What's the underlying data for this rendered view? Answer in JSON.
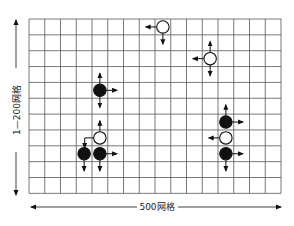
{
  "diagram": {
    "grid": {
      "columns": 16,
      "rows": 11,
      "left": 29,
      "top": 19,
      "cell_w": 15.75,
      "cell_h": 15.85,
      "line_color": "#555555"
    },
    "labels": {
      "horizontal": "500网格",
      "vertical": "1—200网格"
    },
    "stones": [
      {
        "id": "black-1",
        "color": "black",
        "col": 4,
        "row": 4,
        "arrows": [
          "up",
          "down",
          "right"
        ]
      },
      {
        "id": "white-1",
        "color": "white",
        "col": 8,
        "row": 0,
        "arrows": [
          "left",
          "down"
        ]
      },
      {
        "id": "white-2",
        "color": "white",
        "col": 11,
        "row": 2,
        "arrows": [
          "up",
          "down",
          "left"
        ]
      },
      {
        "id": "white-3",
        "color": "white",
        "col": 4,
        "row": 7,
        "arrows": [
          "up",
          "left-down"
        ]
      },
      {
        "id": "black-2",
        "color": "black",
        "col": 3,
        "row": 8,
        "arrows": [
          "down"
        ]
      },
      {
        "id": "black-3",
        "color": "black",
        "col": 4,
        "row": 8,
        "arrows": [
          "down",
          "right"
        ]
      },
      {
        "id": "black-4",
        "color": "black",
        "col": 12,
        "row": 6,
        "arrows": [
          "up",
          "right"
        ]
      },
      {
        "id": "white-4",
        "color": "white",
        "col": 12,
        "row": 7,
        "arrows": [
          "left"
        ]
      },
      {
        "id": "black-5",
        "color": "black",
        "col": 12,
        "row": 8,
        "arrows": [
          "right",
          "down"
        ]
      }
    ],
    "colors": {
      "black_stone": "#111111",
      "white_stone": "#ffffff",
      "stroke": "#111111"
    }
  }
}
